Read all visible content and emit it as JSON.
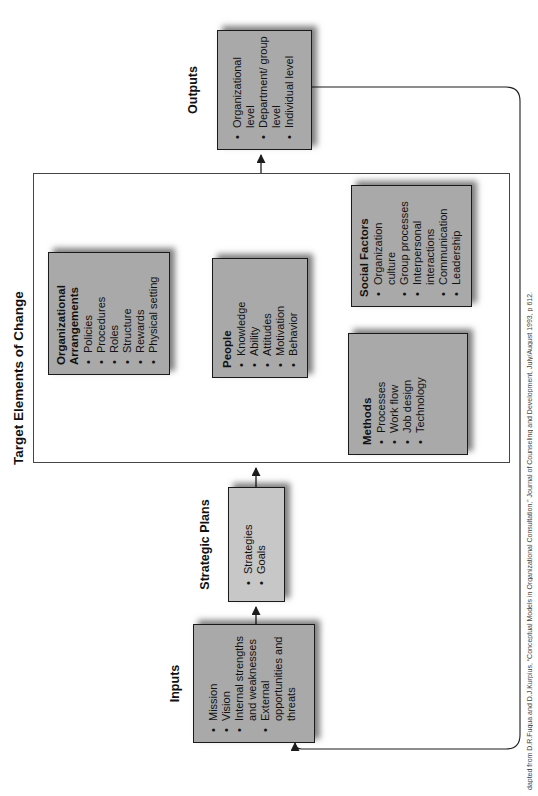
{
  "title": "Target Elements of Change",
  "caption": "dapted from D.R.Fuqua and D.J.Kurpius, “Conceptual Models in Organizational Consultation,” Journal of Counseling and Development, July/August 1993, p 612.",
  "flow": {
    "inputs": {
      "label": "Inputs",
      "items": [
        "Mission",
        "Vision",
        "Internal strengths and weaknesses",
        "External opportunities and threats"
      ]
    },
    "strategic_plans": {
      "label": "Strategic Plans",
      "items": [
        "Strategies",
        "Goals"
      ]
    },
    "outputs": {
      "label": "Outputs",
      "items": [
        "Organizational level",
        "Department/ group level",
        "Individual level"
      ]
    }
  },
  "target_elements": {
    "organizational_arrangements": {
      "title": "Organizational Arrangements",
      "items": [
        "Policies",
        "Procedures",
        "Roles",
        "Structure",
        "Rewards",
        "Physical setting"
      ]
    },
    "people": {
      "title": "People",
      "items": [
        "Knowledge",
        "Ability",
        "Attitudes",
        "Motivation",
        "Behavior"
      ]
    },
    "methods": {
      "title": "Methods",
      "items": [
        "Processes",
        "Work flow",
        "Job design",
        "Technology"
      ]
    },
    "social_factors": {
      "title": "Social Factors",
      "items": [
        "Organization culture",
        "Group processes",
        "Interpersonal interactions",
        "Communication",
        "Leadership"
      ]
    }
  },
  "colors": {
    "box_fill": "#a9a9a9",
    "strategic_plans_fill": "#c7c7c7",
    "line": "#1c1c1c",
    "background": "#ffffff"
  }
}
